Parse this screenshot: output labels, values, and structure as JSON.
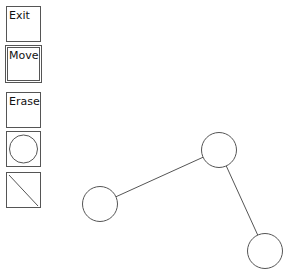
{
  "toolbar": {
    "tools": [
      {
        "id": "exit",
        "label": "Exit",
        "top": 6,
        "selected": false
      },
      {
        "id": "move",
        "label": "Move",
        "top": 46,
        "selected": true
      },
      {
        "id": "erase",
        "label": "Erase",
        "top": 92,
        "selected": false
      },
      {
        "id": "circle",
        "icon": "circle-icon",
        "top": 131,
        "selected": false
      },
      {
        "id": "line",
        "icon": "line-icon",
        "top": 172,
        "selected": false
      }
    ]
  },
  "graph": {
    "stroke_color": "#555555",
    "node_radius": 17.5,
    "nodes": [
      {
        "id": "n1",
        "x": 219,
        "y": 150
      },
      {
        "id": "n2",
        "x": 100,
        "y": 204
      },
      {
        "id": "n3",
        "x": 265,
        "y": 251
      }
    ],
    "edges": [
      {
        "from": "n1",
        "to": "n2"
      },
      {
        "from": "n1",
        "to": "n3"
      }
    ]
  }
}
